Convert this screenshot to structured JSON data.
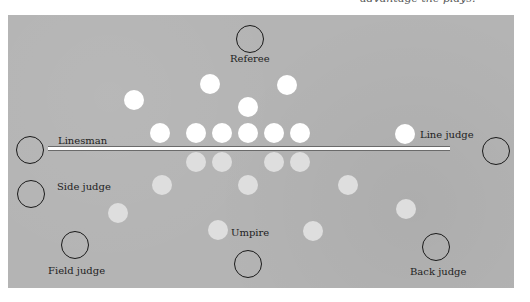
{
  "caption": "advantage the plays.",
  "colors": {
    "field": "#b4b4b4",
    "offense": "#ffffff",
    "defense": "#dedede",
    "official_outline": "#1a1a1a",
    "line_of_scrimmage": "#ffffff"
  },
  "officials": [
    {
      "name": "Referee",
      "cx": 250,
      "cy": 39,
      "label_x": 230,
      "label_y": 53
    },
    {
      "name": "Linesman",
      "cx": 30,
      "cy": 150,
      "label_x": 58,
      "label_y": 135
    },
    {
      "name": "Line judge",
      "cx": 496,
      "cy": 151,
      "label_x": 420,
      "label_y": 129
    },
    {
      "name": "Side judge",
      "cx": 31,
      "cy": 194,
      "label_x": 57,
      "label_y": 181
    },
    {
      "name": "Field judge",
      "cx": 75,
      "cy": 245,
      "label_x": 48,
      "label_y": 265
    },
    {
      "name": "Umpire",
      "cx": 248,
      "cy": 264,
      "label_x": 231,
      "label_y": 227
    },
    {
      "name": "Back judge",
      "cx": 436,
      "cy": 247,
      "label_x": 410,
      "label_y": 266
    }
  ],
  "offense_players": [
    {
      "cx": 160,
      "cy": 133
    },
    {
      "cx": 196,
      "cy": 133
    },
    {
      "cx": 222,
      "cy": 133
    },
    {
      "cx": 248,
      "cy": 133
    },
    {
      "cx": 274,
      "cy": 133
    },
    {
      "cx": 300,
      "cy": 133
    },
    {
      "cx": 134,
      "cy": 100
    },
    {
      "cx": 210,
      "cy": 84
    },
    {
      "cx": 287,
      "cy": 85
    },
    {
      "cx": 248,
      "cy": 107
    },
    {
      "cx": 405,
      "cy": 134
    }
  ],
  "defense_players": [
    {
      "cx": 196,
      "cy": 162
    },
    {
      "cx": 222,
      "cy": 162
    },
    {
      "cx": 274,
      "cy": 162
    },
    {
      "cx": 300,
      "cy": 162
    },
    {
      "cx": 162,
      "cy": 185
    },
    {
      "cx": 248,
      "cy": 185
    },
    {
      "cx": 348,
      "cy": 185
    },
    {
      "cx": 118,
      "cy": 213
    },
    {
      "cx": 406,
      "cy": 209
    },
    {
      "cx": 218,
      "cy": 230
    },
    {
      "cx": 313,
      "cy": 231
    }
  ]
}
